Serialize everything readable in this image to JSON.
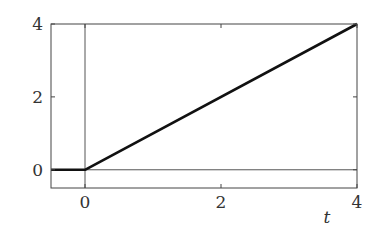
{
  "chart_data": {
    "type": "line",
    "title": "",
    "xlabel": "t",
    "ylabel": "",
    "xlim": [
      -0.5,
      4
    ],
    "ylim": [
      -0.5,
      4
    ],
    "grid": false,
    "x_ticks": [
      0,
      2,
      4
    ],
    "y_ticks": [
      0,
      2,
      4
    ],
    "x_tick_labels": [
      "0",
      "2",
      "4"
    ],
    "y_tick_labels": [
      "0",
      "2",
      "4"
    ],
    "reference_lines": {
      "horizontal_y": 0,
      "vertical_x": 0
    },
    "series": [
      {
        "name": "ramp",
        "x": [
          -0.5,
          0,
          4
        ],
        "y": [
          0,
          0,
          4
        ]
      }
    ],
    "colors": {
      "series": "#111111",
      "axes": "#444444",
      "reference": "#555555"
    }
  }
}
